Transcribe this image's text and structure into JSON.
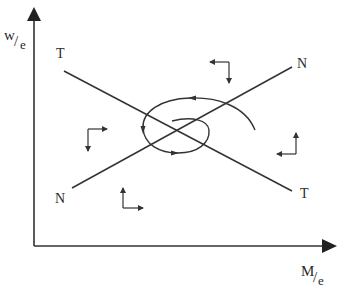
{
  "diagram": {
    "type": "phase-diagram",
    "colors": {
      "line": "#333333",
      "background": "#ffffff"
    },
    "axes": {
      "y_label": {
        "num": "w",
        "slash": "/",
        "den": "e"
      },
      "x_label": {
        "num": "M",
        "slash": "/",
        "den": "e"
      }
    },
    "curves": [
      {
        "id": "TT",
        "label_start": "T",
        "label_end": "T"
      },
      {
        "id": "NN",
        "label_start": "N",
        "label_end": "N"
      }
    ],
    "spiral": {
      "direction": "counter-clockwise",
      "converges_to": "intersection"
    },
    "direction_arrows": [
      {
        "region": "top",
        "horizontal": "left",
        "vertical": "down"
      },
      {
        "region": "left",
        "horizontal": "right",
        "vertical": "down"
      },
      {
        "region": "right",
        "horizontal": "left",
        "vertical": "up"
      },
      {
        "region": "bottom",
        "horizontal": "right",
        "vertical": "up"
      }
    ]
  }
}
